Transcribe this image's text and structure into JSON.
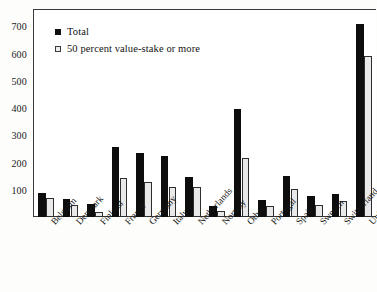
{
  "chart_data": {
    "type": "bar",
    "title": "",
    "xlabel": "",
    "ylabel": "",
    "ylim": [
      0,
      760
    ],
    "yticks": [
      100,
      200,
      300,
      400,
      500,
      600,
      700
    ],
    "grid": false,
    "legend_position": "top-left",
    "categories": [
      "Belgium",
      "Denmark",
      "Finland",
      "France",
      "Germany",
      "Italy",
      "Netherlands",
      "Norway",
      "Other",
      "Portugal",
      "Spain",
      "Sweden",
      "Switzerland",
      "United Kingdom"
    ],
    "series": [
      {
        "name": "Total",
        "color": "#0d0d0d",
        "values": [
          88,
          65,
          48,
          258,
          235,
          225,
          148,
          42,
          398,
          62,
          152,
          78,
          85,
          710
        ]
      },
      {
        "name": "50 percent value-stake or more",
        "color": "#e9e9e9",
        "values": [
          68,
          45,
          20,
          145,
          128,
          112,
          110,
          22,
          218,
          40,
          102,
          45,
          58,
          590
        ]
      }
    ]
  },
  "legend": {
    "items": [
      {
        "label": "Total",
        "swatch": "filled-square-icon"
      },
      {
        "label": "50 percent value-stake or more",
        "swatch": "open-square-icon"
      }
    ]
  },
  "caption": {
    "text": ""
  }
}
